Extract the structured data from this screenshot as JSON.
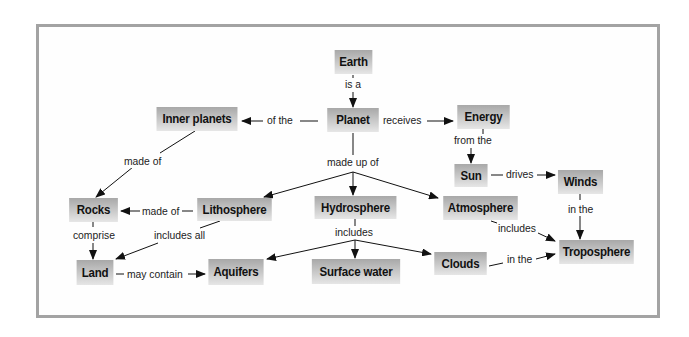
{
  "diagram": {
    "type": "concept-map",
    "nodes": {
      "earth": "Earth",
      "planet": "Planet",
      "inner_planets": "Inner planets",
      "energy": "Energy",
      "sun": "Sun",
      "winds": "Winds",
      "rocks": "Rocks",
      "lithosphere": "Lithosphere",
      "hydrosphere": "Hydrosphere",
      "atmosphere": "Atmosphere",
      "land": "Land",
      "aquifers": "Aquifers",
      "surface_water": "Surface water",
      "clouds": "Clouds",
      "troposphere": "Troposphere"
    },
    "links": {
      "earth_planet": "is a",
      "planet_inner": "of the",
      "planet_energy": "receives",
      "energy_sun": "from the",
      "sun_winds": "drives",
      "inner_rocks": "made of",
      "planet_parts": "made up of",
      "litho_rocks": "made of",
      "rocks_land": "comprise",
      "litho_land": "includes all",
      "hydro_parts": "includes",
      "atmo_tropo": "includes",
      "winds_tropo": "in the",
      "land_aquifers": "may contain",
      "clouds_tropo": "in the"
    },
    "colors": {
      "frame": "#a3a3a3",
      "node_top": "#a8a8a8",
      "node_bottom": "#e6e6e6",
      "line": "#111111"
    }
  }
}
